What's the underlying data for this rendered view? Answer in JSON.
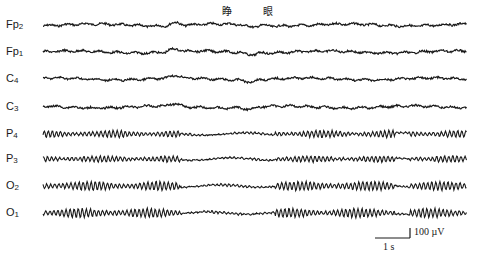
{
  "chart_data": {
    "type": "line",
    "title": "",
    "event_marker": {
      "label": "睁 眼",
      "meaning": "eyes open",
      "x_start_px": 180,
      "x_end_px": 275
    },
    "channels": [
      {
        "name": "Fp2",
        "label_main": "Fp",
        "label_sub": "2",
        "baseline_y": 25,
        "rhythm": "low-amplitude mixed",
        "amplitude_px": 1.6
      },
      {
        "name": "Fp1",
        "label_main": "Fp",
        "label_sub": "1",
        "baseline_y": 52,
        "rhythm": "low-amplitude mixed",
        "amplitude_px": 1.6
      },
      {
        "name": "C4",
        "label_main": "C",
        "label_sub": "4",
        "baseline_y": 79,
        "rhythm": "low-amplitude mixed",
        "amplitude_px": 1.5
      },
      {
        "name": "C3",
        "label_main": "C",
        "label_sub": "3",
        "baseline_y": 107,
        "rhythm": "low-amplitude mixed",
        "amplitude_px": 1.6
      },
      {
        "name": "P4",
        "label_main": "P",
        "label_sub": "4",
        "baseline_y": 134,
        "rhythm": "alpha",
        "amplitude_px": 3.5
      },
      {
        "name": "P3",
        "label_main": "P",
        "label_sub": "3",
        "baseline_y": 159,
        "rhythm": "alpha",
        "amplitude_px": 3.0
      },
      {
        "name": "O2",
        "label_main": "O",
        "label_sub": "2",
        "baseline_y": 186,
        "rhythm": "alpha",
        "amplitude_px": 4.5
      },
      {
        "name": "O1",
        "label_main": "O",
        "label_sub": "1",
        "baseline_y": 213,
        "rhythm": "alpha",
        "amplitude_px": 4.5
      }
    ],
    "x_range_px": [
      43,
      467
    ],
    "alpha_suppression_segments_px": [
      [
        180,
        275
      ],
      [
        395,
        410
      ]
    ],
    "scale_bar": {
      "time_label": "1 s",
      "amplitude_label": "100 µV",
      "time_px": 35,
      "amp_px": 10
    },
    "grid": false,
    "legend": "none"
  },
  "labels": {
    "event": "睁 眼",
    "scale_time": "1 s",
    "scale_amp": "100 µV"
  }
}
